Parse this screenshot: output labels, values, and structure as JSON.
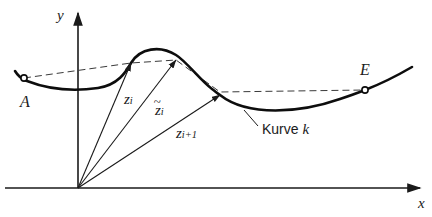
{
  "figure": {
    "background_color": "#ffffff",
    "ink_color": "#1a1a1a",
    "width": 432,
    "height": 217
  },
  "axes": {
    "x_label": "x",
    "y_label": "y",
    "origin": {
      "x": 78,
      "y": 188
    },
    "x_axis": {
      "x1": 5,
      "y1": 188,
      "x2": 425,
      "y2": 188
    },
    "y_axis": {
      "x1": 78,
      "y1": 188,
      "x2": 78,
      "y2": 8
    }
  },
  "points": {
    "start": {
      "label": "A",
      "x": 24,
      "y": 78,
      "label_x": 20,
      "label_y": 94
    },
    "end": {
      "label": "E",
      "x": 365,
      "y": 90,
      "label_x": 360,
      "label_y": 62
    },
    "nodes": [
      {
        "x": 131,
        "y": 63
      },
      {
        "x": 176,
        "y": 60
      },
      {
        "x": 220,
        "y": 95
      }
    ]
  },
  "vectors": [
    {
      "name": "z_i",
      "label_main": "z",
      "label_sub": "i",
      "tilde": false,
      "from_x": 78,
      "from_y": 188,
      "to_x": 131,
      "to_y": 63,
      "label_x": 124,
      "label_y": 92
    },
    {
      "name": "z_i_tilde",
      "label_main": "z",
      "label_sub": "i",
      "tilde": true,
      "from_x": 78,
      "from_y": 188,
      "to_x": 176,
      "to_y": 60,
      "label_x": 155,
      "label_y": 103
    },
    {
      "name": "z_i_plus_1",
      "label_main": "z",
      "label_sub": "i+1",
      "tilde": false,
      "from_x": 78,
      "from_y": 188,
      "to_x": 220,
      "to_y": 95,
      "label_x": 176,
      "label_y": 126
    }
  ],
  "curve": {
    "label": "Kurve ",
    "label_italic": "k",
    "label_x": 262,
    "label_y": 129,
    "leader": {
      "x1": 258,
      "y1": 126,
      "x2": 244,
      "y2": 110
    },
    "path": "M 15,71 C 18,76 21,79 27,81 C 45,88 70,92 98,88 C 118,85 126,72 131,63 C 140,48 160,45 176,55 C 186,61 200,80 212,89 C 216,92 218,94 220,95 C 248,117 300,113 340,99 C 352,95 360,92 365,90 C 383,83 400,74 412,67"
  },
  "chord_polyline": {
    "name": "dashed-chord-polyline",
    "points": [
      {
        "x": 24,
        "y": 78
      },
      {
        "x": 131,
        "y": 63
      },
      {
        "x": 176,
        "y": 60
      },
      {
        "x": 220,
        "y": 92
      },
      {
        "x": 365,
        "y": 90
      }
    ]
  }
}
